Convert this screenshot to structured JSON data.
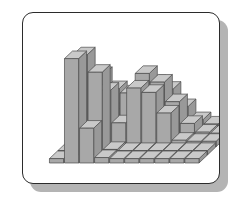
{
  "card": {
    "name": "chart-card",
    "background": "#ffffff",
    "border_color": "#2b2b2b",
    "shadow_color": "#b4b4b4",
    "corner_radius": 11
  },
  "chart_data": {
    "type": "bar",
    "subtype": "3d-bar-histogram",
    "title": "",
    "subtitle": "",
    "xlabel": "",
    "ylabel": "",
    "zlabel": "",
    "grid": false,
    "legend": false,
    "legend_position": "none",
    "axis_labels_visible": false,
    "tick_labels_visible": false,
    "projection": "oblique-isometric",
    "depth_direction": "up-right",
    "x_categories": [
      "1",
      "2",
      "3",
      "4",
      "5",
      "6",
      "7",
      "8",
      "9",
      "10"
    ],
    "y_categories": [
      "A",
      "B",
      "C",
      "D",
      "E"
    ],
    "zlim": [
      0,
      10
    ],
    "series": [
      {
        "name": "A",
        "values": [
          0.4,
          9.6,
          3.2,
          0.5,
          0.4,
          0.4,
          0.4,
          0.4,
          0.4,
          0.4
        ]
      },
      {
        "name": "B",
        "values": [
          0.4,
          9.2,
          7.6,
          0.5,
          0.4,
          0.4,
          0.4,
          0.4,
          0.4,
          0.4
        ]
      },
      {
        "name": "C",
        "values": [
          0.5,
          6.4,
          5.2,
          2.2,
          5.4,
          5.0,
          3.1,
          0.6,
          0.5,
          0.5
        ]
      },
      {
        "name": "D",
        "values": [
          0.5,
          5.9,
          4.6,
          4.2,
          6.0,
          5.2,
          3.4,
          1.4,
          0.6,
          0.5
        ]
      },
      {
        "name": "E",
        "values": [
          0.5,
          0.6,
          2.0,
          3.6,
          4.4,
          3.8,
          2.2,
          1.0,
          0.6,
          0.5
        ]
      }
    ],
    "colors": {
      "front_face": "#a8a8a8",
      "top_face": "#c9c9c9",
      "side_face": "#999999",
      "outline": "#4a4a4a",
      "plot_background": "#ffffff"
    },
    "annotations": []
  }
}
